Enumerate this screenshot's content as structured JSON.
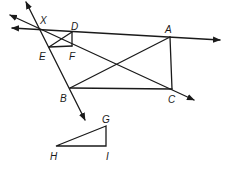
{
  "diagram": {
    "type": "geometry",
    "points": {
      "X": {
        "label": "X",
        "x": 40,
        "y": 29
      },
      "D": {
        "label": "D",
        "x": 72,
        "y": 32
      },
      "A": {
        "label": "A",
        "x": 170,
        "y": 37
      },
      "E": {
        "label": "E",
        "x": 49,
        "y": 47
      },
      "F": {
        "label": "F",
        "x": 72,
        "y": 46
      },
      "B": {
        "label": "B",
        "x": 70,
        "y": 88
      },
      "C": {
        "label": "C",
        "x": 172,
        "y": 89
      },
      "G": {
        "label": "G",
        "x": 106,
        "y": 126
      },
      "H": {
        "label": "H",
        "x": 56,
        "y": 146
      },
      "I": {
        "label": "I",
        "x": 106,
        "y": 146
      }
    },
    "lines": [
      {
        "name": "line-XA",
        "description": "Line through X, D, A with arrows both ends"
      },
      {
        "name": "line-XC",
        "description": "Ray from upper-left through X and C"
      },
      {
        "name": "line-XEB",
        "description": "Line through X, E, B with arrows both ends"
      }
    ],
    "figures": [
      {
        "name": "rectangle-DEFX-small",
        "vertices": [
          "X",
          "D",
          "F",
          "E"
        ]
      },
      {
        "name": "quadrilateral-ABC",
        "vertices": [
          "A",
          "C",
          "B"
        ]
      },
      {
        "name": "triangle-GHI",
        "vertices": [
          "G",
          "H",
          "I"
        ]
      }
    ]
  }
}
